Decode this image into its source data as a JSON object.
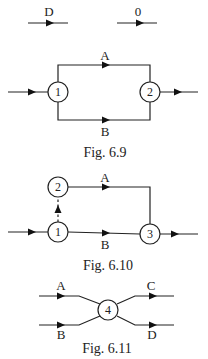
{
  "legend": {
    "activity": {
      "label": "D",
      "meaning": "activity-arrow"
    },
    "dummy": {
      "label": "0",
      "meaning": "dummy-activity-arrow"
    }
  },
  "fig_6_9": {
    "caption": "Fig. 6.9",
    "nodes": [
      {
        "id": "1"
      },
      {
        "id": "2"
      }
    ],
    "activities": [
      {
        "label": "A",
        "from": "1",
        "to": "2"
      },
      {
        "label": "B",
        "from": "1",
        "to": "2"
      }
    ]
  },
  "fig_6_10": {
    "caption": "Fig. 6.10",
    "nodes": [
      {
        "id": "1"
      },
      {
        "id": "2"
      },
      {
        "id": "3"
      }
    ],
    "activities": [
      {
        "label": "A",
        "from": "2",
        "to": "3"
      },
      {
        "label": "B",
        "from": "1",
        "to": "3"
      },
      {
        "label": "",
        "from": "1",
        "to": "2",
        "type": "dummy"
      }
    ]
  },
  "fig_6_11": {
    "caption": "Fig. 6.11",
    "nodes": [
      {
        "id": "4"
      }
    ],
    "activities": [
      {
        "label": "A",
        "to": "4"
      },
      {
        "label": "B",
        "to": "4"
      },
      {
        "label": "C",
        "from": "4"
      },
      {
        "label": "D",
        "from": "4"
      }
    ]
  }
}
